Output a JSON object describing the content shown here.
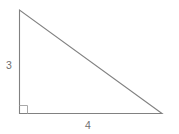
{
  "figure": {
    "shape": "right-triangle",
    "labels": {
      "vertical_leg": "3",
      "horizontal_leg": "4"
    },
    "colors": {
      "line": "#818181",
      "marker": "#a9a9a9",
      "text": "#6f6f6f",
      "background": "#ffffff"
    }
  }
}
